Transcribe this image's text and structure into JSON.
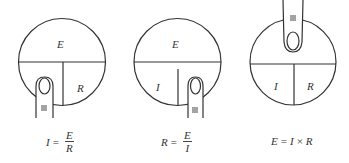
{
  "diagrams": [
    {
      "id": "find-current",
      "covered": "I",
      "labels": {
        "top": "E",
        "bottom_right": "R"
      },
      "formula": {
        "lhs": "I",
        "eq": "=",
        "numerator": "E",
        "denominator": "R"
      }
    },
    {
      "id": "find-resistance",
      "covered": "R",
      "labels": {
        "top": "E",
        "bottom_left": "I"
      },
      "formula": {
        "lhs": "R",
        "eq": "=",
        "numerator": "E",
        "denominator": "I"
      }
    },
    {
      "id": "find-voltage",
      "covered": "E",
      "labels": {
        "bottom_left": "I",
        "bottom_right": "R"
      },
      "formula": {
        "lhs": "E",
        "eq": "=",
        "a": "I",
        "op": "×",
        "b": "R"
      }
    }
  ],
  "colors": {
    "stroke": "#333333",
    "background": "#ffffff"
  }
}
